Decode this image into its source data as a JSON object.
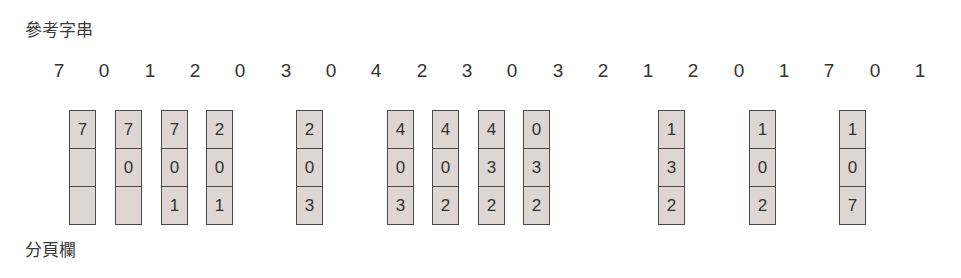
{
  "labels": {
    "reference_string": "參考字串",
    "page_frames": "分頁欄"
  },
  "reference_string": [
    "7",
    "0",
    "1",
    "2",
    "0",
    "3",
    "0",
    "4",
    "2",
    "3",
    "0",
    "3",
    "2",
    "1",
    "2",
    "0",
    "1",
    "7",
    "0",
    "1"
  ],
  "ref_x": [
    59,
    104,
    150,
    195,
    240,
    286,
    331,
    376,
    422,
    467,
    512,
    558,
    603,
    648,
    693,
    739,
    784,
    829,
    875,
    920
  ],
  "frames": [
    {
      "ref_index": 0,
      "x": 69,
      "cells": [
        "7",
        "",
        ""
      ]
    },
    {
      "ref_index": 1,
      "x": 115,
      "cells": [
        "7",
        "0",
        ""
      ]
    },
    {
      "ref_index": 2,
      "x": 161,
      "cells": [
        "7",
        "0",
        "1"
      ]
    },
    {
      "ref_index": 3,
      "x": 206,
      "cells": [
        "2",
        "0",
        "1"
      ]
    },
    {
      "ref_index": 5,
      "x": 296,
      "cells": [
        "2",
        "0",
        "3"
      ]
    },
    {
      "ref_index": 7,
      "x": 387,
      "cells": [
        "4",
        "0",
        "3"
      ]
    },
    {
      "ref_index": 8,
      "x": 432,
      "cells": [
        "4",
        "0",
        "2"
      ]
    },
    {
      "ref_index": 9,
      "x": 478,
      "cells": [
        "4",
        "3",
        "2"
      ]
    },
    {
      "ref_index": 10,
      "x": 523,
      "cells": [
        "0",
        "3",
        "2"
      ]
    },
    {
      "ref_index": 13,
      "x": 658,
      "cells": [
        "1",
        "3",
        "2"
      ]
    },
    {
      "ref_index": 15,
      "x": 749,
      "cells": [
        "1",
        "0",
        "2"
      ]
    },
    {
      "ref_index": 18,
      "x": 839,
      "cells": [
        "1",
        "0",
        "7"
      ]
    }
  ],
  "colors": {
    "frame_fill": "#ddd6d4",
    "frame_border": "#4a4a4a",
    "text": "#333333"
  }
}
